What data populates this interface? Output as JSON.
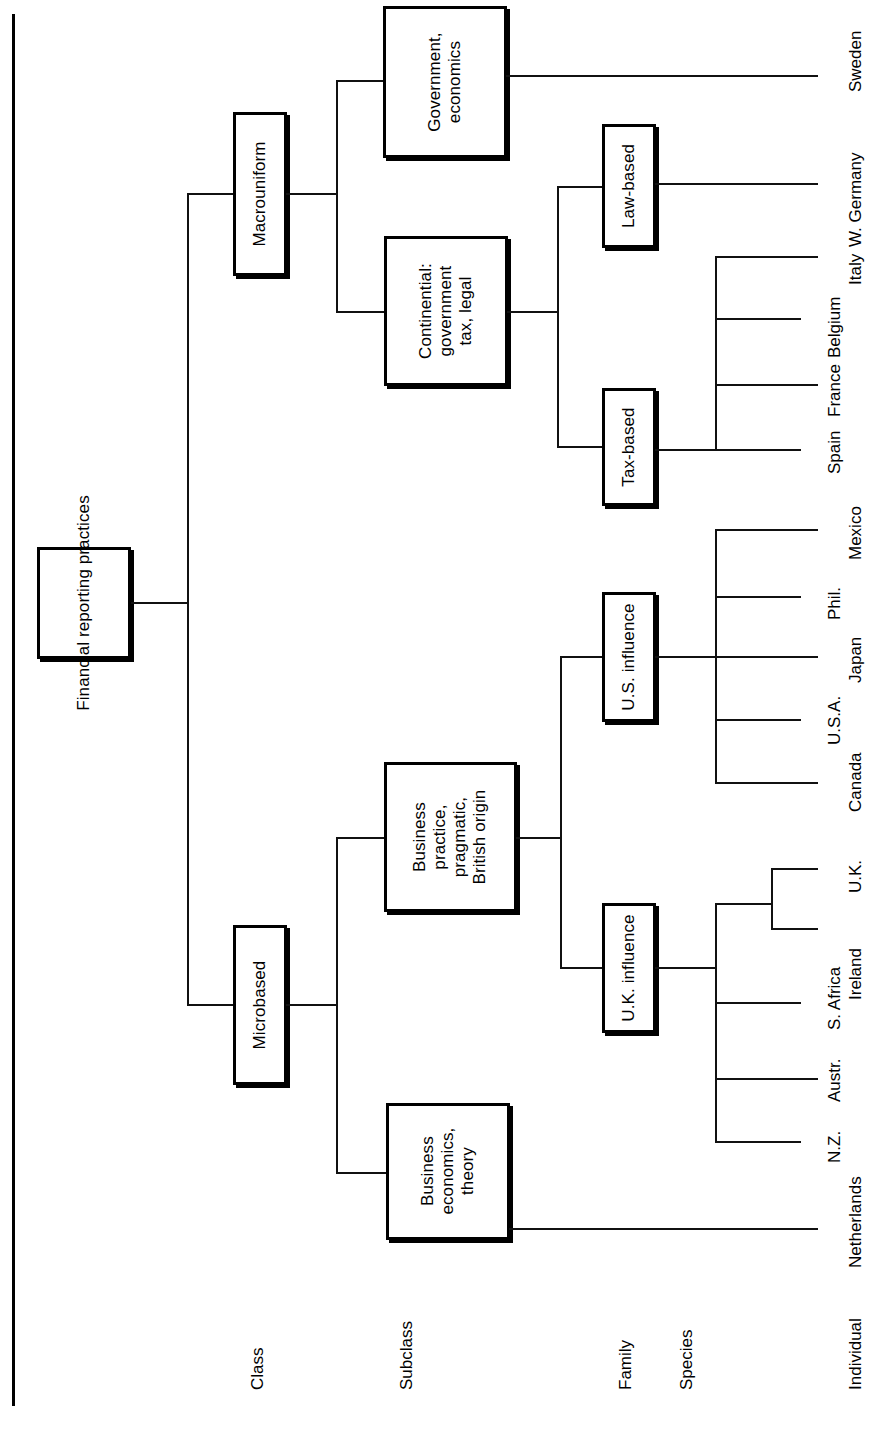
{
  "diagram": {
    "title_root": "Financial reporting practices",
    "orientation": "rotated-90-ccw",
    "level_labels": [
      {
        "key": "class",
        "label": "Class"
      },
      {
        "key": "subclass",
        "label": "Subclass"
      },
      {
        "key": "family",
        "label": "Family"
      },
      {
        "key": "species",
        "label": "Species"
      },
      {
        "key": "individual",
        "label": "Individual"
      }
    ],
    "nodes": {
      "root": "Financial reporting practices",
      "class_macrouniform": "Macrouniform",
      "class_microbased": "Microbased",
      "subclass_government": "Government,\neconomics",
      "subclass_continential": "Continential:\ngovernment\ntax, legal",
      "subclass_business_practice": "Business\npractice,\npragmatic,\nBritish origin",
      "subclass_business_economics": "Business\neconomics,\ntheory",
      "family_law_based": "Law-based",
      "family_tax_based": "Tax-based",
      "family_us_influence": "U.S. influence",
      "family_uk_influence": "U.K. influence"
    },
    "leaves": [
      {
        "key": "sweden",
        "label": "Sweden"
      },
      {
        "key": "w-germany",
        "label": "W. Germany"
      },
      {
        "key": "italy",
        "label": "Italy"
      },
      {
        "key": "belgium",
        "label": "Belgium"
      },
      {
        "key": "france",
        "label": "France"
      },
      {
        "key": "spain",
        "label": "Spain"
      },
      {
        "key": "mexico",
        "label": "Mexico"
      },
      {
        "key": "phil",
        "label": "Phil."
      },
      {
        "key": "japan",
        "label": "Japan"
      },
      {
        "key": "usa",
        "label": "U.S.A."
      },
      {
        "key": "canada",
        "label": "Canada"
      },
      {
        "key": "uk",
        "label": "U.K."
      },
      {
        "key": "ireland",
        "label": "Ireland"
      },
      {
        "key": "s-africa",
        "label": "S. Africa"
      },
      {
        "key": "austr",
        "label": "Austr."
      },
      {
        "key": "nz",
        "label": "N.Z."
      },
      {
        "key": "netherlands",
        "label": "Netherlands"
      }
    ]
  }
}
